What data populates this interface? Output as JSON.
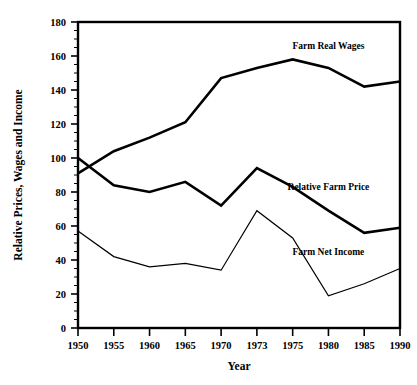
{
  "chart_data": {
    "type": "line",
    "title": "",
    "xlabel": "Year",
    "ylabel": "Relative Prices, Wages and Income",
    "categories": [
      "1950",
      "1955",
      "1960",
      "1965",
      "1970",
      "1973",
      "1975",
      "1980",
      "1985",
      "1990"
    ],
    "ylim": [
      0,
      180
    ],
    "ytick_labels": [
      "0",
      "20",
      "40",
      "60",
      "80",
      "100",
      "120",
      "140",
      "160",
      "180"
    ],
    "ytick_values": [
      0,
      20,
      40,
      60,
      80,
      100,
      120,
      140,
      160,
      180
    ],
    "y_minor_tick_step": 5,
    "grid": false,
    "legend_position": "inline-annotations",
    "series": [
      {
        "name": "Farm Real Wages",
        "values": [
          91,
          104,
          112,
          121,
          147,
          153,
          158,
          153,
          142,
          145
        ],
        "line_weight": "thick",
        "color": "#000000",
        "annotation_x": "1980",
        "annotation_y": 166
      },
      {
        "name": "Relative Farm Price",
        "values": [
          100,
          84,
          80,
          86,
          72,
          94,
          83,
          69,
          56,
          59
        ],
        "line_weight": "thick",
        "color": "#000000",
        "annotation_x": "1980",
        "annotation_y": 83
      },
      {
        "name": "Farm Net Income",
        "values": [
          57,
          42,
          36,
          38,
          34,
          69,
          53,
          19,
          26,
          35
        ],
        "line_weight": "thin",
        "color": "#000000",
        "annotation_x": "1980",
        "annotation_y": 45
      }
    ]
  },
  "axes": {
    "x_title": "Year",
    "y_title": "Relative Prices, Wages and Income"
  }
}
